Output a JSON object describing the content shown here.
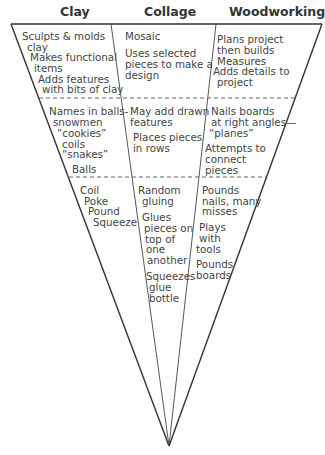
{
  "headers": {
    "clay": "Clay",
    "collage": "Collage",
    "woodworking": "Woodworking"
  },
  "levels": [
    {
      "clay": [
        "Sculpts & molds",
        "clay",
        "Makes functional",
        "items",
        "Adds features",
        "with bits of clay"
      ],
      "collage": [
        "Mosaic",
        "Uses selected",
        "pieces to make a",
        "design"
      ],
      "woodworking": [
        "Plans project",
        "then builds",
        "Measures",
        "Adds details to",
        "project"
      ]
    },
    {
      "clay": [
        "Names in balls-",
        "snowmen",
        "“cookies”",
        "coils",
        "“snakes”",
        "Balls"
      ],
      "collage": [
        "May add drawn",
        "features",
        "Places pieces",
        "in rows"
      ],
      "woodworking": [
        "Nails boards",
        "at right angles—",
        "“planes”",
        "Attempts to",
        "connect",
        "pieces"
      ]
    },
    {
      "clay": [
        "Coil",
        "Poke",
        "Pound",
        "Squeeze"
      ],
      "collage": [
        "Random",
        "gluing",
        "Glues",
        "pieces on",
        "top of",
        "one",
        "another",
        "Squeezes",
        "glue",
        "bottle"
      ],
      "woodworking": [
        "Pounds",
        "nails, many",
        "misses",
        "Plays",
        "with",
        "tools",
        "Pounds",
        "boards"
      ]
    }
  ],
  "colors": {
    "line": "#333333",
    "dash": "#555555",
    "text": "#444444"
  }
}
